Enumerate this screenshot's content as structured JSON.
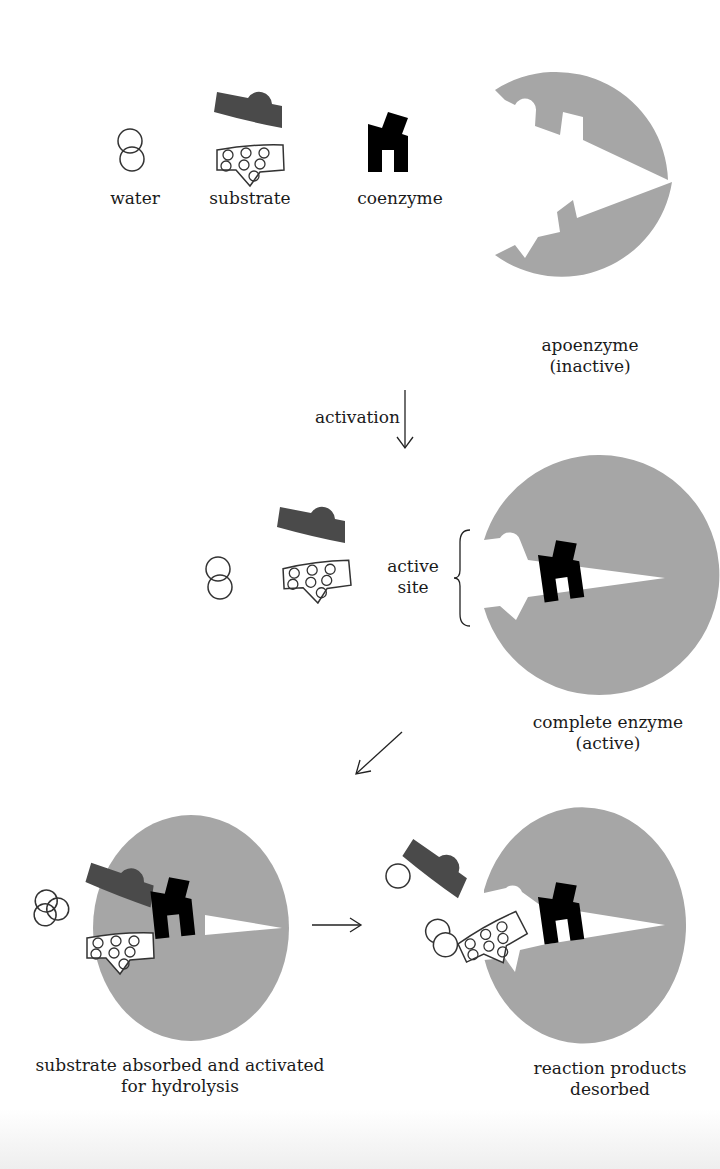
{
  "colors": {
    "enzyme": "#a6a6a6",
    "substrate_dark": "#4a4a4a",
    "coenzyme": "#000000",
    "outline": "#333333",
    "background": "#ffffff"
  },
  "row1": {
    "water_label": "water",
    "substrate_label": "substrate",
    "coenzyme_label": "coenzyme",
    "apoenzyme_label_line1": "apoenzyme",
    "apoenzyme_label_line2": "(inactive)"
  },
  "arrow1": {
    "label": "activation",
    "direction": "down"
  },
  "row2": {
    "active_site_line1": "active",
    "active_site_line2": "site",
    "complete_label_line1": "complete enzyme",
    "complete_label_line2": "(active)"
  },
  "arrow2": {
    "direction": "down-left"
  },
  "row3": {
    "left_label_line1": "substrate absorbed and activated",
    "left_label_line2": "for hydrolysis",
    "arrow_direction": "right",
    "right_label_line1": "reaction products",
    "right_label_line2": "desorbed"
  }
}
